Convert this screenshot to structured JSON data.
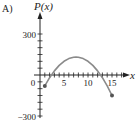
{
  "panel_label": "A)",
  "chart_data": {
    "type": "line",
    "title": "",
    "xlabel": "x",
    "ylabel": "P(x)",
    "xlim": [
      0,
      16
    ],
    "ylim": [
      -300,
      350
    ],
    "x_ticks": [
      0,
      5,
      10,
      15
    ],
    "x_tick_labels": [
      "0",
      "5",
      "10",
      "15"
    ],
    "y_ticks": [
      -300,
      300
    ],
    "y_tick_labels": [
      "-300",
      "300"
    ],
    "minor_tick_step_x": 1,
    "minor_tick_step_y": 50,
    "grid": false,
    "series": [
      {
        "name": "P(x)",
        "x": [
          1,
          2,
          3,
          4,
          5,
          6,
          7,
          7.5,
          8,
          9,
          10,
          11,
          12,
          13,
          14,
          15
        ],
        "values": [
          -80,
          -20,
          30,
          70,
          100,
          120,
          130,
          131,
          130,
          120,
          100,
          70,
          30,
          -20,
          -80,
          -150
        ],
        "endpoints": [
          {
            "x": 1,
            "y": -80
          },
          {
            "x": 15,
            "y": -150
          }
        ]
      }
    ],
    "colors": {
      "curve": "#8a8a8a",
      "axes": "#222222",
      "endpoint": "#555555"
    }
  }
}
